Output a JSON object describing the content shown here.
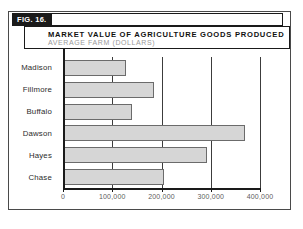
{
  "figure": {
    "number_label": "FIG. 16.",
    "title": "MARKET VALUE OF AGRICULTURE GOODS PRODUCED",
    "subtitle": "AVERAGE FARM (DOLLARS)"
  },
  "colors": {
    "bar_fill": "#d6d6d6",
    "bar_stroke": "#6b6b6b",
    "frame": "#1a1a1a",
    "subtitle_text": "#9a9a9a",
    "tick_text": "#5d5d5d"
  },
  "chart_data": {
    "type": "bar",
    "orientation": "horizontal",
    "title": "MARKET VALUE OF AGRICULTURE GOODS PRODUCED",
    "subtitle": "AVERAGE FARM (DOLLARS)",
    "xlabel": "",
    "ylabel": "",
    "categories": [
      "Madison",
      "Fillmore",
      "Buffalo",
      "Dawson",
      "Hayes",
      "Chase"
    ],
    "values": [
      128000,
      185000,
      140000,
      370000,
      292000,
      206000
    ],
    "xlim": [
      0,
      400000
    ],
    "xticks": [
      0,
      100000,
      200000,
      300000,
      400000
    ],
    "xticklabels": [
      "0",
      "100,000",
      "200,000",
      "300,000",
      "400,000"
    ],
    "grid": "vertical",
    "legend": "none"
  }
}
